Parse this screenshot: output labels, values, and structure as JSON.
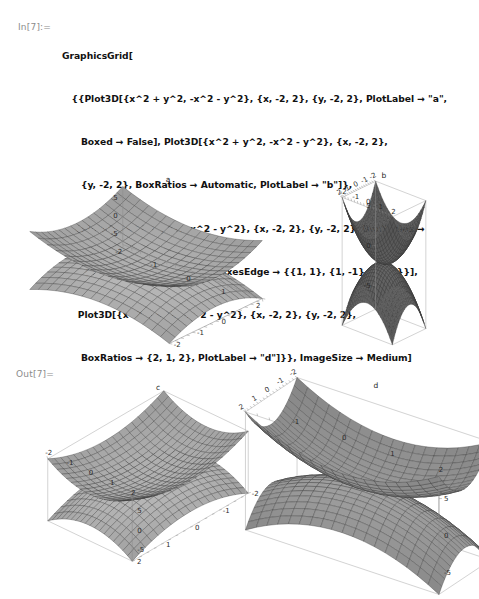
{
  "notebook": {
    "in_prompt": "In[7]:=",
    "out_prompt": "Out[7]=",
    "code_lines": [
      "GraphicsGrid[",
      "   {{Plot3D[{x^2 + y^2, -x^2 - y^2}, {x, -2, 2}, {y, -2, 2}, PlotLabel → \"a\",",
      "      Boxed → False], Plot3D[{x^2 + y^2, -x^2 - y^2}, {x, -2, 2},",
      "      {y, -2, 2}, BoxRatios → Automatic, PlotLabel → \"b\"]},",
      "    {Plot3D[{x^2 + y^2, -x^2 - y^2}, {x, -2, 2}, {y, -2, 2}, BoxRatios →",
      "       {1, 2, 1}, PlotLabel → \"c\", AxesEdge → {{1, 1}, {1, -1}, {1, 1}}],",
      "     Plot3D[{x^2 + y^2, -x^2 - y^2}, {x, -2, 2}, {y, -2, 2},",
      "      BoxRatios → {2, 1, 2}, PlotLabel → \"d\"]}}, ImageSize → Medium]"
    ]
  },
  "colors": {
    "surface_light": "#c9c9c9",
    "surface_mid": "#a8a8a8",
    "surface_dark": "#6e6e6e",
    "mesh": "#3a3a3a",
    "axis": "#8e8e8e",
    "frame": "#b5b5b5",
    "text": "#1a1a1a",
    "prompt": "#8c8c8c",
    "background": "#ffffff"
  },
  "chart_data": [
    {
      "type": "surface",
      "id": "a",
      "title": "a",
      "functions": [
        "x^2 + y^2",
        "-x^2 - y^2"
      ],
      "xlabel": "x",
      "ylabel": "y",
      "zlabel": "z",
      "xlim": [
        -2,
        2
      ],
      "ylim": [
        -2,
        2
      ],
      "zlim": [
        -8,
        8
      ],
      "xticks": [
        -2,
        -1,
        0,
        1,
        2
      ],
      "yticks": [
        0,
        -1,
        -2
      ],
      "zticks": [
        5,
        0,
        -5
      ],
      "boxed": false,
      "box_ratios": "default",
      "grid": true,
      "legend": "none"
    },
    {
      "type": "surface",
      "id": "b",
      "title": "b",
      "functions": [
        "x^2 + y^2",
        "-x^2 - y^2"
      ],
      "xlabel": "x",
      "ylabel": "y",
      "zlabel": "z",
      "xlim": [
        -2,
        2
      ],
      "ylim": [
        -2,
        2
      ],
      "zlim": [
        -8,
        8
      ],
      "xticks": [
        -2,
        -1,
        0,
        1,
        2
      ],
      "yticks": [
        -2,
        -1,
        0,
        1,
        2
      ],
      "zticks": [
        5,
        0,
        -5
      ],
      "boxed": true,
      "box_ratios": "Automatic",
      "grid": true,
      "legend": "none"
    },
    {
      "type": "surface",
      "id": "c",
      "title": "c",
      "functions": [
        "x^2 + y^2",
        "-x^2 - y^2"
      ],
      "xlabel": "x",
      "ylabel": "y",
      "zlabel": "z",
      "xlim": [
        -2,
        2
      ],
      "ylim": [
        -2,
        2
      ],
      "zlim": [
        -8,
        8
      ],
      "xticks": [
        -2,
        -1,
        0,
        1,
        2
      ],
      "yticks": [
        2,
        1,
        0,
        -1,
        -2
      ],
      "zticks": [
        5,
        0,
        -5
      ],
      "boxed": true,
      "box_ratios": "{1, 2, 1}",
      "axes_edge": "{{1, 1}, {1, -1}, {1, 1}}",
      "grid": true,
      "legend": "none"
    },
    {
      "type": "surface",
      "id": "d",
      "title": "d",
      "functions": [
        "x^2 + y^2",
        "-x^2 - y^2"
      ],
      "xlabel": "x",
      "ylabel": "y",
      "zlabel": "z",
      "xlim": [
        -2,
        2
      ],
      "ylim": [
        -2,
        2
      ],
      "zlim": [
        -8,
        8
      ],
      "xticks": [
        -1,
        0,
        1,
        2
      ],
      "yticks": [
        -2,
        -1,
        0,
        1,
        2
      ],
      "zticks": [
        5,
        0,
        -5
      ],
      "boxed": true,
      "box_ratios": "{2, 1, 2}",
      "grid": true,
      "legend": "none"
    }
  ]
}
